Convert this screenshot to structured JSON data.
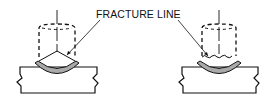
{
  "diagram": {
    "label": "FRACTURE LINE",
    "figures": [
      {
        "name": "v-groove-fracture",
        "fracture_shape": "straight angled lines"
      },
      {
        "name": "wavy-fracture",
        "fracture_shape": "irregular wavy line"
      }
    ],
    "colors": {
      "line": "#111111",
      "weld_bead": "#a9a9a9",
      "background": "#ffffff"
    }
  }
}
